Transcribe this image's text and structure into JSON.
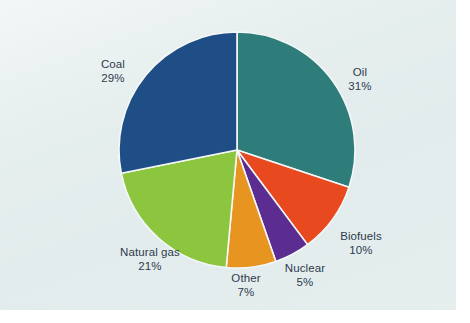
{
  "figure": {
    "background_color": "#ffffff",
    "panel_color": "#e3ecec",
    "label_text_color": "#2d3b4e",
    "separator_color": "#f4f8f8"
  },
  "chart_data": {
    "type": "pie",
    "title": "",
    "subtitle": "",
    "xlabel": "",
    "ylabel": "",
    "legend_position": "none",
    "grid": false,
    "start_angle_deg": 0,
    "direction": "clockwise",
    "unit": "%",
    "categories": [
      "Oil",
      "Biofuels",
      "Nuclear",
      "Other",
      "Natural gas",
      "Coal"
    ],
    "values": [
      31,
      10,
      5,
      7,
      21,
      29
    ],
    "colors": [
      "#2e7d7b",
      "#e8491f",
      "#5c2d91",
      "#e89420",
      "#8cc63e",
      "#1f4e87"
    ],
    "slices": [
      {
        "label": "Oil",
        "value": 31,
        "value_text": "31%",
        "color": "#2e7d7b"
      },
      {
        "label": "Biofuels",
        "value": 10,
        "value_text": "10%",
        "color": "#e8491f"
      },
      {
        "label": "Nuclear",
        "value": 5,
        "value_text": "5%",
        "color": "#5c2d91"
      },
      {
        "label": "Other",
        "value": 7,
        "value_text": "7%",
        "color": "#e89420"
      },
      {
        "label": "Natural gas",
        "value": 21,
        "value_text": "21%",
        "color": "#8cc63e"
      },
      {
        "label": "Coal",
        "value": 29,
        "value_text": "29%",
        "color": "#1f4e87"
      }
    ]
  }
}
